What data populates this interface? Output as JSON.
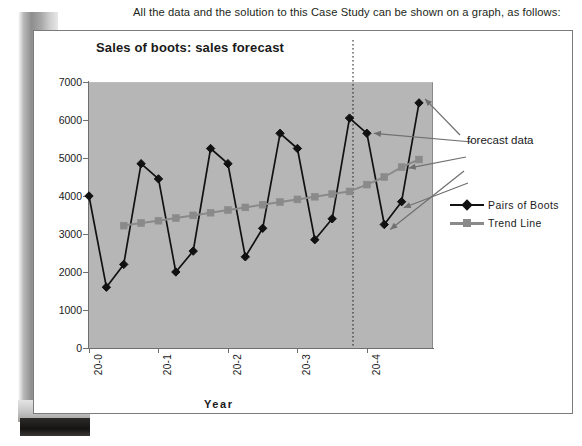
{
  "caption": "All the data and the solution to this Case Study can be shown on a graph, as follows:",
  "chart_title": "Sales of boots: sales forecast",
  "annotation": {
    "forecast_label": "forecast data"
  },
  "legend": {
    "position": "right",
    "items": [
      {
        "label": "Pairs  of  Boots",
        "color": "#111111",
        "marker": "diamond"
      },
      {
        "label": "Trend  Line",
        "color": "#8a8a8a",
        "marker": "square"
      }
    ]
  },
  "colors": {
    "plot_background": "#b6b6b6",
    "series_pairs_of_boots": "#111111",
    "series_trend_line": "#8a8a8a",
    "arrow": "#6f6f6f",
    "axis": "#6f6f6f",
    "text": "#1a1a1a",
    "figure_border": "#7b7b7b"
  },
  "chart_data": {
    "type": "line",
    "title": "Sales of boots: sales forecast",
    "xlabel": "Year",
    "ylabel": "Sales  (pairs)",
    "ylim": [
      0,
      7000
    ],
    "yticks": [
      0,
      1000,
      2000,
      3000,
      4000,
      5000,
      6000,
      7000
    ],
    "ytick_labels": [
      "0",
      "1000",
      "2000",
      "3000",
      "4000",
      "5000",
      "6000",
      "7000"
    ],
    "xtick_labels": [
      "20-0",
      "20-1",
      "20-2",
      "20-3",
      "20-4"
    ],
    "xtick_indices": [
      0,
      4,
      8,
      12,
      16
    ],
    "grid": false,
    "x": [
      0,
      1,
      2,
      3,
      4,
      5,
      6,
      7,
      8,
      9,
      10,
      11,
      12,
      13,
      14,
      15,
      16,
      17,
      18,
      19
    ],
    "forecast_divider_index": 15.2,
    "forecast_start_index": 16,
    "series": [
      {
        "name": "Pairs  of  Boots",
        "marker": "diamond",
        "color": "#111111",
        "values": [
          4000,
          1600,
          2200,
          4850,
          4450,
          2000,
          2550,
          5250,
          4850,
          2400,
          3150,
          5650,
          5250,
          2850,
          3400,
          6050,
          5650,
          3250,
          3850,
          6450
        ]
      },
      {
        "name": "Trend  Line",
        "marker": "square",
        "color": "#8a8a8a",
        "values": [
          null,
          null,
          3220,
          3290,
          3350,
          3420,
          3490,
          3560,
          3630,
          3700,
          3770,
          3840,
          3910,
          3980,
          4050,
          4120,
          4300,
          4500,
          4760,
          4960
        ]
      }
    ],
    "annotations": [
      {
        "text": "forecast data",
        "points_to": [
          "last-boots-point",
          "forecast-trend-points",
          "forecast-boots-points"
        ]
      }
    ]
  }
}
